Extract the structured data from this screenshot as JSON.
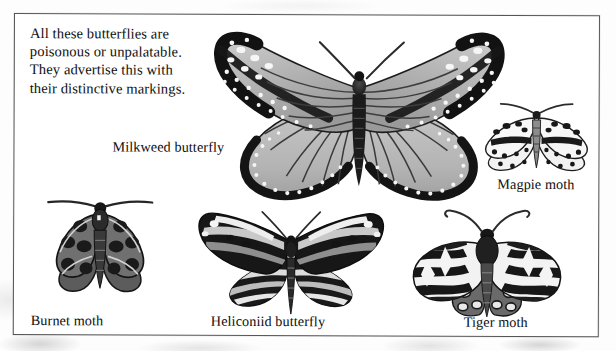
{
  "page": {
    "kind": "book-illustration-scan",
    "frame_border_color": "#555555",
    "background_color": "#ffffff",
    "ink_color": "#0d0d0d"
  },
  "caption": {
    "lines": [
      "All these butterflies are",
      "poisonous or unpalatable.",
      "They advertise this with",
      "their distinctive markings."
    ],
    "line1": "All these butterflies are",
    "line2": "poisonous or unpalatable.",
    "line3": "They advertise this with",
    "line4": "their distinctive markings."
  },
  "figures": [
    {
      "id": "milkweed-butterfly",
      "label": "Milkweed butterfly",
      "kind": "butterfly",
      "description": "Large monarch-type butterfly, pale grey wings with dark veins, broad black margins filled with white spots, wings spread symmetrically",
      "label_position": "left-of-body"
    },
    {
      "id": "magpie-moth",
      "label": "Magpie moth",
      "kind": "moth",
      "description": "Small white moth with rows of black spots and a dark band across each forewing",
      "label_position": "below"
    },
    {
      "id": "burnet-moth",
      "label": "Burnet moth",
      "kind": "moth",
      "description": "Dark grey moth with long straight antennae and black blotches on the forewings",
      "label_position": "below"
    },
    {
      "id": "heliconiid-butterfly",
      "label": "Heliconiid butterfly",
      "kind": "butterfly",
      "description": "Long narrow wings banded in black, white and grey stripes, long slender abdomen",
      "label_position": "below"
    },
    {
      "id": "tiger-moth",
      "label": "Tiger moth",
      "kind": "moth",
      "description": "Moth with boldly marbled black and white forewings and dark spotted hindwings, curved antennae",
      "label_position": "below"
    }
  ],
  "labels": {
    "milkweed": "Milkweed butterfly",
    "magpie": "Magpie moth",
    "burnet": "Burnet moth",
    "heliconiid": "Heliconiid butterfly",
    "tiger": "Tiger moth"
  }
}
